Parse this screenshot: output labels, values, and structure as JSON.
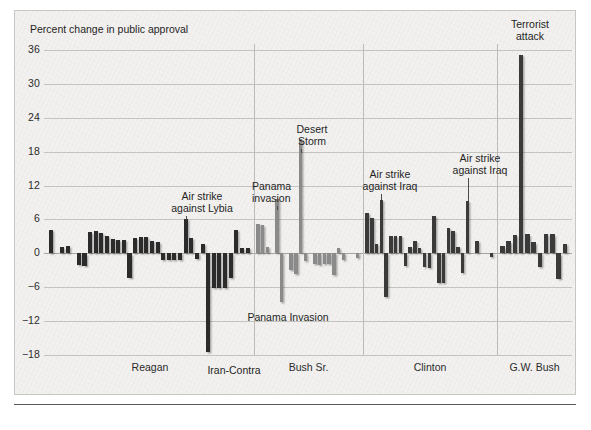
{
  "chart_data": {
    "type": "bar",
    "title": "",
    "ylabel": "Percent change in public approval",
    "xlabel": "",
    "ylim": [
      -18,
      36
    ],
    "yticks": [
      36,
      30,
      24,
      18,
      12,
      6,
      0,
      -6,
      -12,
      -18
    ],
    "grid": true,
    "legend_position": "none",
    "categories": [
      "Reagan",
      "Bush Sr.",
      "Clinton",
      "G.W. Bush"
    ],
    "groups": [
      {
        "name": "Reagan",
        "color": "#2b2b2b",
        "values": [
          4.2,
          0,
          1.2,
          1.3,
          0,
          -2.1,
          -2.2,
          3.8,
          3.9,
          3.6,
          3.1,
          2.6,
          2.4,
          2.3,
          -4.4,
          2.8,
          2.9,
          2.9,
          2.2,
          2.0,
          -1.1,
          -1.1,
          -1.2,
          -1.2,
          6.0,
          2.8,
          -1.0,
          1.6,
          -17.4,
          -6.2,
          -6.1,
          -6.1,
          -4.4,
          4.1,
          1.0,
          1.0
        ]
      },
      {
        "name": "Bush Sr.",
        "color": "#8a8a8a",
        "values": [
          5.2,
          5.0,
          1.1,
          0,
          9.6,
          -8.7,
          0,
          -3.0,
          -3.6,
          20.2,
          -1.3,
          0,
          -1.9,
          -2.0,
          -1.9,
          -1.9,
          -3.9,
          1.0,
          -1.2,
          0,
          0,
          -0.9
        ]
      },
      {
        "name": "Clinton",
        "color": "#3a3a3a",
        "values": [
          7.2,
          6.2,
          1.6,
          9.4,
          -7.8,
          3.1,
          3.1,
          3.0,
          -2.3,
          1.2,
          2.1,
          1.0,
          -2.5,
          -2.6,
          6.6,
          -5.2,
          -5.3,
          4.4,
          3.9,
          1.1,
          -3.4,
          9.3,
          0,
          2.2,
          0,
          0,
          -0.6
        ]
      },
      {
        "name": "G.W. Bush",
        "color": "#3a3a3a",
        "values": [
          1.3,
          2.2,
          3.3,
          35.2,
          3.4,
          2.0,
          -2.4,
          3.4,
          3.4,
          -4.6,
          1.6
        ]
      }
    ],
    "annotations": [
      {
        "label": "Air strike\nagainst Lybia",
        "group": "Reagan",
        "value": 6.0
      },
      {
        "label": "Iran-Contra",
        "group": "Reagan",
        "value": -17.4
      },
      {
        "label": "Panama\ninvasion",
        "group": "Bush Sr.",
        "value": 9.6
      },
      {
        "label": "Panama Invasion",
        "group": "Bush Sr.",
        "value": -8.7
      },
      {
        "label": "Desert\nStorm",
        "group": "Bush Sr.",
        "value": 20.2
      },
      {
        "label": "Air strike\nagainst Iraq",
        "group": "Clinton",
        "value": 9.4
      },
      {
        "label": "Air strike\nagainst Iraq",
        "group": "Clinton",
        "value": 9.3
      },
      {
        "label": "Terrorist\nattack",
        "group": "G.W. Bush",
        "value": 35.2
      }
    ]
  },
  "axis": {
    "title": "Percent change in public approval",
    "ticks": {
      "t36": "36",
      "t30": "30",
      "t24": "24",
      "t18": "18",
      "t12": "12",
      "t6": "6",
      "t0": "0",
      "tm6": "−6",
      "tm12": "−12",
      "tm18": "−18"
    }
  },
  "eras": {
    "reagan": "Reagan",
    "bush_sr": "Bush Sr.",
    "clinton": "Clinton",
    "gw_bush": "G.W. Bush"
  },
  "annotations": {
    "lybia": "Air strike\nagainst Lybia",
    "iran_contra": "Iran-Contra",
    "panama_invasion_top": "Panama\ninvasion",
    "panama_invasion_bottom": "Panama Invasion",
    "desert_storm": "Desert\nStorm",
    "iraq_1": "Air strike\nagainst Iraq",
    "iraq_2": "Air strike\nagainst Iraq",
    "terrorist_attack": "Terrorist\nattack"
  },
  "colors": {
    "panel_bg": "#f2f1ef",
    "bar_dark": "#2b2b2b",
    "bar_mid": "#3a3a3a",
    "bar_gray": "#8a8a8a",
    "gridline": "#c5c3bf",
    "text": "#1f1f1f"
  }
}
